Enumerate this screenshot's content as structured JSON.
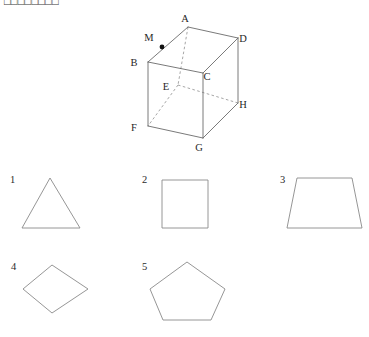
{
  "question": {
    "prompt": "□□□□□□□□"
  },
  "figure": {
    "name": "cube-with-point-m",
    "type": "cube",
    "vertices": [
      {
        "label": "A",
        "x": 188,
        "y": 27,
        "label_x": 185,
        "label_y": 22,
        "hidden": false
      },
      {
        "label": "B",
        "x": 148,
        "y": 62,
        "label_x": 134,
        "label_y": 66,
        "hidden": false
      },
      {
        "label": "C",
        "x": 203,
        "y": 73,
        "label_x": 207,
        "label_y": 80,
        "hidden": false
      },
      {
        "label": "D",
        "x": 238,
        "y": 38,
        "label_x": 243,
        "label_y": 42,
        "hidden": false
      },
      {
        "label": "E",
        "x": 178,
        "y": 85,
        "label_x": 166,
        "label_y": 90,
        "hidden": true
      },
      {
        "label": "F",
        "x": 148,
        "y": 126,
        "label_x": 134,
        "label_y": 131,
        "hidden": false
      },
      {
        "label": "G",
        "x": 203,
        "y": 138,
        "label_x": 199,
        "label_y": 151,
        "hidden": false
      },
      {
        "label": "H",
        "x": 238,
        "y": 103,
        "label_x": 243,
        "label_y": 108,
        "hidden": false
      }
    ],
    "marked_point": {
      "label": "M",
      "x": 162,
      "y": 47,
      "label_x": 149,
      "label_y": 41,
      "on_edge": "B-A"
    },
    "solid_edges": [
      "A,188,27,B,148,62",
      "A,188,27,D,238,38",
      "B,148,62,C,203,73",
      "C,203,73,D,238,38",
      "B,148,62,F,148,126",
      "C,203,73,G,203,138",
      "D,238,38,H,238,103",
      "F,148,126,G,203,138",
      "G,203,138,H,238,103"
    ],
    "hidden_edges": [
      "A,188,27,E,178,85",
      "E,178,85,F,148,126",
      "E,178,85,H,238,103"
    ]
  },
  "options": [
    {
      "number": "1",
      "shape_name": "triangle",
      "number_x": 10,
      "number_y": 183,
      "points": "50,178 80,228 22,228"
    },
    {
      "number": "2",
      "shape_name": "square",
      "number_x": 142,
      "number_y": 183,
      "points": "162,180 208,180 208,228 162,228"
    },
    {
      "number": "3",
      "shape_name": "trapezoid",
      "number_x": 280,
      "number_y": 183,
      "points": "297,178 352,178 362,228 287,228"
    },
    {
      "number": "4",
      "shape_name": "rhombus",
      "number_x": 11,
      "number_y": 270,
      "points": "52,265 88,289 52,313 23,289"
    },
    {
      "number": "5",
      "shape_name": "pentagon",
      "number_x": 142,
      "number_y": 270,
      "points": "187,262 225,289 211,320 163,320 150,289"
    }
  ]
}
